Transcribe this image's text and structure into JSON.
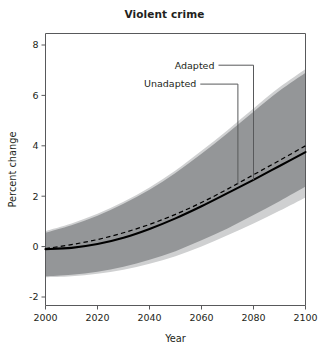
{
  "chart_data": {
    "type": "line",
    "title": "Violent crime",
    "xlabel": "Year",
    "ylabel": "Percent change",
    "xlim": [
      2000,
      2100
    ],
    "ylim": [
      -2,
      8
    ],
    "xticks": [
      2000,
      2020,
      2040,
      2060,
      2080,
      2100
    ],
    "yticks": [
      -2,
      0,
      2,
      4,
      6,
      8
    ],
    "grid": false,
    "legend_position": "inline-annotation",
    "colors": {
      "line": "#000000",
      "band_inner": "#949698",
      "band_outer": "#cfd0d1",
      "axis": "#58595b",
      "text": "#231f20"
    },
    "x": [
      2000,
      2010,
      2020,
      2030,
      2040,
      2050,
      2060,
      2070,
      2080,
      2090,
      2100
    ],
    "series": [
      {
        "name": "Adapted",
        "style": "solid",
        "values": [
          -0.1,
          -0.05,
          0.1,
          0.35,
          0.7,
          1.12,
          1.6,
          2.12,
          2.65,
          3.2,
          3.75
        ]
      },
      {
        "name": "Unadapted",
        "style": "dashed",
        "values": [
          -0.08,
          0.08,
          0.28,
          0.55,
          0.88,
          1.28,
          1.75,
          2.28,
          2.85,
          3.42,
          4.0
        ]
      }
    ],
    "bands": [
      {
        "name": "outer-uncertainty",
        "fill": "#cfd0d1",
        "upper": [
          0.62,
          0.92,
          1.3,
          1.78,
          2.35,
          3.02,
          3.8,
          4.62,
          5.48,
          6.32,
          7.05
        ],
        "lower": [
          -1.22,
          -1.18,
          -1.08,
          -0.92,
          -0.68,
          -0.38,
          0.0,
          0.45,
          0.92,
          1.42,
          1.95
        ]
      },
      {
        "name": "inner-uncertainty",
        "fill": "#949698",
        "upper": [
          0.55,
          0.85,
          1.22,
          1.7,
          2.26,
          2.92,
          3.68,
          4.5,
          5.35,
          6.18,
          6.9
        ],
        "lower": [
          -1.18,
          -1.12,
          -1.0,
          -0.8,
          -0.52,
          -0.18,
          0.25,
          0.72,
          1.25,
          1.8,
          2.38
        ]
      }
    ],
    "annotations": [
      {
        "label": "Adapted",
        "target_series": "Adapted",
        "target_x": 2080,
        "target_y": 2.65,
        "label_x": 2065,
        "label_y": 7.2
      },
      {
        "label": "Unadapted",
        "target_series": "Unadapted",
        "target_x": 2074,
        "target_y": 2.48,
        "label_x": 2058,
        "label_y": 6.45
      }
    ]
  }
}
